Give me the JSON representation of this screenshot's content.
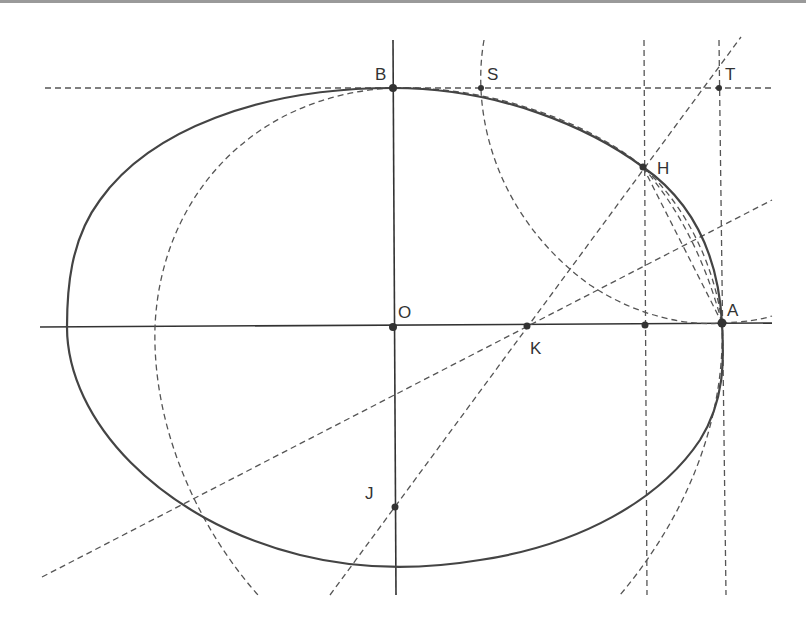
{
  "diagram": {
    "stroke_color": "#333333",
    "background": "#ffffff",
    "points": [
      {
        "id": "B",
        "label": "B",
        "x": 393,
        "y": 88,
        "lx": 375,
        "ly": 80
      },
      {
        "id": "S",
        "label": "S",
        "x": 481,
        "y": 88,
        "lx": 487,
        "ly": 80
      },
      {
        "id": "T",
        "label": "T",
        "x": 719,
        "y": 88,
        "lx": 725,
        "ly": 80
      },
      {
        "id": "H",
        "label": "H",
        "x": 643,
        "y": 167,
        "lx": 658,
        "ly": 173
      },
      {
        "id": "O",
        "label": "O",
        "x": 393,
        "y": 327,
        "lx": 398,
        "ly": 318
      },
      {
        "id": "K",
        "label": "K",
        "x": 527,
        "y": 326,
        "lx": 530,
        "ly": 353
      },
      {
        "id": "A",
        "label": "A",
        "x": 722,
        "y": 323,
        "lx": 727,
        "ly": 316
      },
      {
        "id": "J",
        "label": "J",
        "x": 395,
        "y": 507,
        "lx": 365,
        "ly": 498
      },
      {
        "id": "Hfoot",
        "label": "",
        "x": 645,
        "y": 325,
        "lx": 0,
        "ly": 0
      }
    ]
  }
}
